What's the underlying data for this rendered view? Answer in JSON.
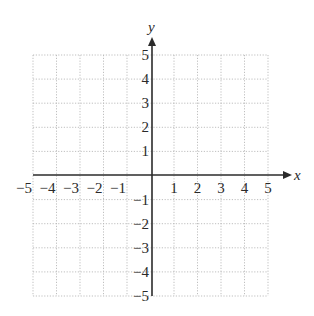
{
  "chart_data": {
    "type": "scatter",
    "title": "",
    "xlabel": "x",
    "ylabel": "y",
    "xlim": [
      -5,
      5
    ],
    "ylim": [
      -5,
      5
    ],
    "grid": true,
    "grid_style": "dotted",
    "x_ticks": [
      -5,
      -4,
      -3,
      -2,
      -1,
      1,
      2,
      3,
      4,
      5
    ],
    "y_ticks": [
      -5,
      -4,
      -3,
      -2,
      -1,
      1,
      2,
      3,
      4,
      5
    ],
    "x_tick_labels": [
      "−5",
      "−4",
      "−3",
      "−2",
      "−1",
      "1",
      "2",
      "3",
      "4",
      "5"
    ],
    "y_tick_labels": [
      "−5",
      "−4",
      "−3",
      "−2",
      "−1",
      "1",
      "2",
      "3",
      "4",
      "5"
    ],
    "series": [],
    "legend": null
  },
  "colors": {
    "axis": "#2b2b2b",
    "grid": "#b8b8b8",
    "background": "#ffffff"
  }
}
